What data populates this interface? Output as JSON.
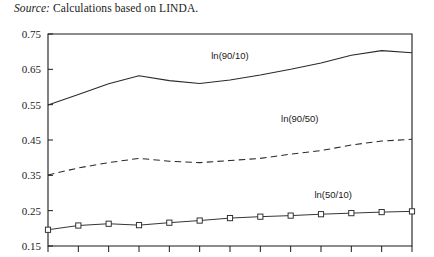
{
  "source_note": {
    "keyword": "Source:",
    "text": " Calculations based on LINDA."
  },
  "chart_data": {
    "type": "line",
    "title": "",
    "xlabel": "",
    "ylabel": "",
    "ylim": [
      0.15,
      0.75
    ],
    "ytick_labels": [
      "0.75",
      "0.65",
      "0.55",
      "0.45",
      "0.35",
      "0.25",
      "0.15"
    ],
    "ytick_values": [
      0.75,
      0.65,
      0.55,
      0.45,
      0.35,
      0.25,
      0.15
    ],
    "grid": false,
    "legend_position": "inline-annotations",
    "x": [
      1,
      2,
      3,
      4,
      5,
      6,
      7,
      8,
      9,
      10,
      11,
      12,
      13
    ],
    "xtick_labels": [
      "",
      "",
      "",
      "",
      "",
      "",
      "",
      "",
      "",
      "",
      "",
      "",
      ""
    ],
    "series": [
      {
        "name": "ln(90/10)",
        "style": "solid",
        "marker": "none",
        "label_x": 7.0,
        "label_y": 0.678,
        "values": [
          0.549,
          0.579,
          0.609,
          0.632,
          0.618,
          0.61,
          0.62,
          0.634,
          0.65,
          0.668,
          0.69,
          0.703,
          0.697
        ]
      },
      {
        "name": "ln(90/50)",
        "style": "dashed",
        "marker": "none",
        "label_x": 9.3,
        "label_y": 0.5,
        "values": [
          0.351,
          0.371,
          0.386,
          0.398,
          0.39,
          0.386,
          0.392,
          0.398,
          0.41,
          0.42,
          0.436,
          0.447,
          0.452
        ]
      },
      {
        "name": "ln(50/10)",
        "style": "solid",
        "marker": "square",
        "label_x": 10.4,
        "label_y": 0.286,
        "values": [
          0.196,
          0.208,
          0.213,
          0.209,
          0.216,
          0.222,
          0.229,
          0.233,
          0.236,
          0.24,
          0.243,
          0.246,
          0.248
        ]
      }
    ],
    "colors": {
      "line": "#2a2a2a",
      "frame": "#1a1a1a",
      "marker_fill": "#ffffff",
      "background": "#ffffff"
    }
  }
}
